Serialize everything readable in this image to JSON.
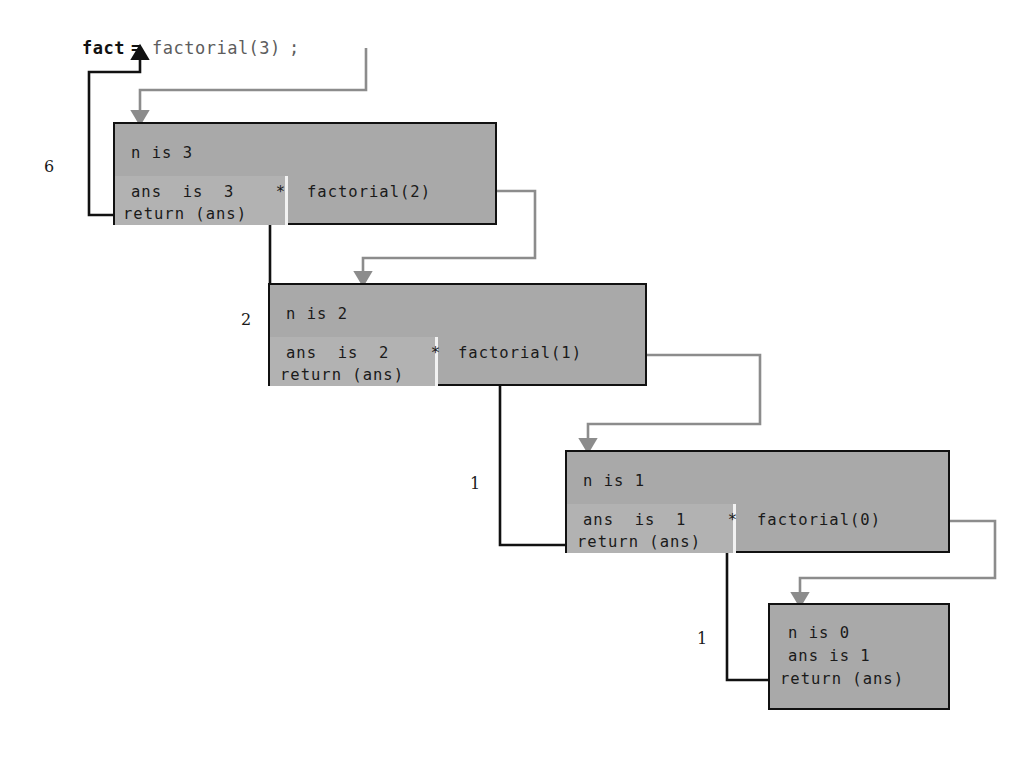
{
  "diagram": {
    "colors": {
      "frame_fill": "#a9a9a9",
      "frame_inner_fill": "#b2b2b2",
      "frame_border": "#111111",
      "call_arrow": "#8c8c8c",
      "return_arrow": "#111111",
      "divider": "#f2f2f2",
      "page_background": "#ffffff",
      "code_gray_text": "#5d5d5d"
    },
    "statement": {
      "variable": "fact",
      "equals": "=",
      "call": "factorial(3)",
      "semicolon": ";"
    },
    "frames": [
      {
        "id": "frame-n3",
        "param_line": "n is 3",
        "ans_line": "ans  is  3    *",
        "return_line": "return (ans)",
        "recursive_call": "factorial(2)",
        "returns": "6"
      },
      {
        "id": "frame-n2",
        "param_line": "n is 2",
        "ans_line": "ans  is  2    *",
        "return_line": "return (ans)",
        "recursive_call": "factorial(1)",
        "returns": "2"
      },
      {
        "id": "frame-n1",
        "param_line": "n is 1",
        "ans_line": "ans  is  1    *",
        "return_line": "return (ans)",
        "recursive_call": "factorial(0)",
        "returns": "1"
      },
      {
        "id": "frame-n0",
        "param_line": "n is 0",
        "ans_line": "ans is 1",
        "return_line": "return (ans)",
        "recursive_call": "",
        "returns": "1"
      }
    ],
    "return_labels": [
      "6",
      "2",
      "1",
      "1"
    ]
  }
}
